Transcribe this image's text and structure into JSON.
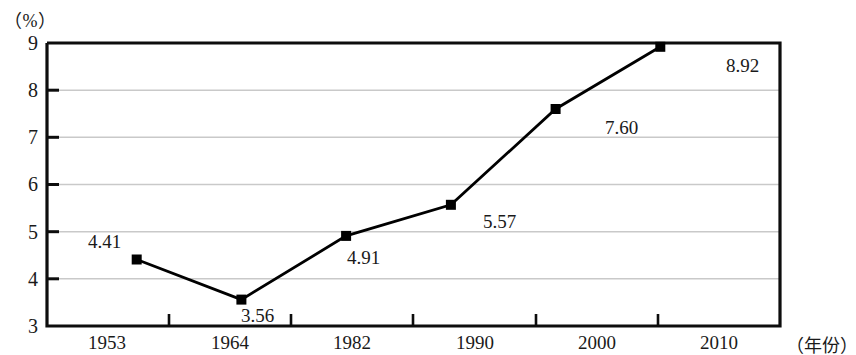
{
  "chart_data": {
    "type": "line",
    "title": "",
    "xlabel": "（年份）",
    "ylabel": "（%）",
    "categories": [
      "1953",
      "1964",
      "1982",
      "1990",
      "2000",
      "2010"
    ],
    "values": [
      4.41,
      3.56,
      4.91,
      5.57,
      7.6,
      8.92
    ],
    "value_labels": [
      "4.41",
      "3.56",
      "4.91",
      "5.57",
      "7.60",
      "8.92"
    ],
    "series": [
      {
        "name": "",
        "values": [
          4.41,
          3.56,
          4.91,
          5.57,
          7.6,
          8.92
        ]
      }
    ],
    "ylim": [
      3,
      9
    ],
    "yticks": [
      "3",
      "4",
      "5",
      "6",
      "7",
      "8",
      "9"
    ],
    "grid": "horizontal",
    "legend": "none",
    "marker": "square",
    "line_color": "#000000",
    "marker_color": "#000000",
    "grid_color": "#c8c8c8",
    "axis_color": "#000000",
    "background": "#ffffff"
  },
  "axes": {
    "y_unit_label": "（%）",
    "x_unit_label": "（年份）"
  },
  "ytick_labels": [
    "9",
    "8",
    "7",
    "6",
    "5",
    "4",
    "3"
  ],
  "xtick_labels": [
    "1953",
    "1964",
    "1982",
    "1990",
    "2000",
    "2010"
  ],
  "point_labels": [
    "4.41",
    "3.56",
    "4.91",
    "5.57",
    "7.60",
    "8.92"
  ]
}
